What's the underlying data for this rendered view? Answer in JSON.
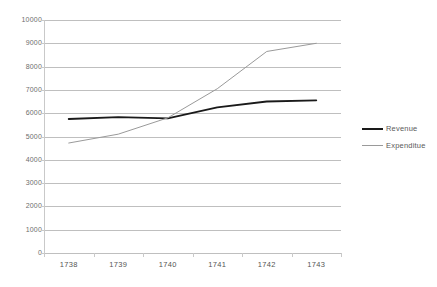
{
  "chart_data": {
    "type": "line",
    "title": "",
    "subtitle": "",
    "xlabel": "",
    "ylabel": "",
    "categories": [
      "1738",
      "1739",
      "1740",
      "1741",
      "1742",
      "1743"
    ],
    "x": [
      1738,
      1739,
      1740,
      1741,
      1742,
      1743
    ],
    "series": [
      {
        "name": "Revenue",
        "color": "#1a1a1a",
        "values": [
          5750,
          5830,
          5780,
          6250,
          6500,
          6550
        ]
      },
      {
        "name": "Expenditue",
        "color": "#9a9a9a",
        "values": [
          4720,
          5100,
          5800,
          7050,
          8650,
          9000
        ]
      }
    ],
    "ylim": [
      0,
      10000
    ],
    "ytick_labels": [
      "0",
      "1000",
      "2000",
      "3000",
      "4000",
      "5000",
      "6000",
      "7000",
      "8000",
      "9000",
      "10000"
    ],
    "ytick_values": [
      0,
      1000,
      2000,
      3000,
      4000,
      5000,
      6000,
      7000,
      8000,
      9000,
      10000
    ],
    "grid": true,
    "grid_axis": "y",
    "legend_position": "right",
    "legend": [
      "Revenue",
      "Expenditue"
    ],
    "annotations": []
  },
  "legend": {
    "items": [
      {
        "label": "Revenue"
      },
      {
        "label": "Expenditue"
      }
    ]
  },
  "colors": {
    "revenue": "#1a1a1a",
    "expenditure": "#9a9a9a",
    "gridline": "#bfbfbf",
    "axis": "#c9c9c9",
    "tick_text": "#6e6e6e",
    "background": "#ffffff"
  }
}
